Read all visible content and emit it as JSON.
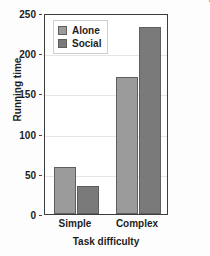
{
  "chart_data": {
    "type": "bar",
    "title": "",
    "categories": [
      "Simple",
      "Complex"
    ],
    "series": [
      {
        "name": "Alone",
        "values": [
          58,
          170
        ],
        "color": "#9b9b9b"
      },
      {
        "name": "Social",
        "values": [
          35,
          232
        ],
        "color": "#7a7a7a"
      }
    ],
    "xlabel": "Task difficulty",
    "ylabel": "Running time",
    "ylim": [
      0,
      250
    ],
    "yticks": [
      0,
      50,
      100,
      150,
      200,
      250
    ],
    "ytick_labels": [
      "0",
      "50",
      "100",
      "150",
      "200",
      "250"
    ],
    "grid": true,
    "legend_position": "top-left"
  },
  "legend": {
    "items": [
      {
        "label": "Alone",
        "color": "#9b9b9b"
      },
      {
        "label": "Social",
        "color": "#7a7a7a"
      }
    ]
  },
  "credit": {
    "text": "From Zajonc, R.B. \"Social enhancement and impairment of performance in the cockroach,\" Journal of Personality and Social Psychology, 13(2), 83-92. Copyright © 1969 by the American Psychological Association. Reprinted by permission."
  },
  "colors": {
    "alone": "#9b9b9b",
    "social": "#7a7a7a",
    "axis": "#3d3d3d",
    "grid": "#e6e6e6",
    "text": "#1d1d1d",
    "credit_text": "#6a6a6a"
  }
}
